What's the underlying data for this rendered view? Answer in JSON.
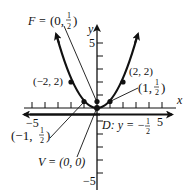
{
  "figure": {
    "type": "parabola-graph",
    "equation": "x^2 = 2y",
    "axes": {
      "x_label": "x",
      "y_label": "y",
      "x_ticks": {
        "min": -5,
        "max": 5,
        "step": 1,
        "labeled": [
          "-5",
          "5"
        ]
      },
      "y_ticks": {
        "min": -5,
        "max": 5,
        "step": 1,
        "labeled": [
          "5",
          "-5"
        ]
      }
    },
    "labels": {
      "focus": "F = (0, 1/2)",
      "focus_prefix": "F = ",
      "focus_open": "(0,",
      "focus_num": "1",
      "focus_den": "2",
      "focus_close": ")",
      "vertex": "V = (0, 0)",
      "directrix": "D: y = −",
      "directrix_num": "1",
      "directrix_den": "2",
      "point_left_high": "(−2, 2)",
      "point_right_high": "(2, 2)",
      "point_right_low_open": "(1,",
      "point_right_low_num": "1",
      "point_right_low_den": "2",
      "point_right_low_close": ")",
      "point_left_low_open": "(−1,",
      "point_left_low_num": "1",
      "point_left_low_den": "2",
      "point_left_low_close": ")",
      "x_tick_neg5": "−5",
      "x_tick_pos5": "5",
      "y_tick_pos5": "5",
      "y_tick_neg5": "−5",
      "x_axis_name": "x",
      "y_axis_name": "y"
    },
    "points": [
      {
        "name": "vertex",
        "x": 0,
        "y": 0
      },
      {
        "name": "focus",
        "x": 0,
        "y": 0.5
      },
      {
        "name": "left-low",
        "x": -1,
        "y": 0.5
      },
      {
        "name": "right-low",
        "x": 1,
        "y": 0.5
      },
      {
        "name": "left-high",
        "x": -2,
        "y": 2
      },
      {
        "name": "right-high",
        "x": 2,
        "y": 2
      }
    ],
    "directrix_y": -0.5,
    "colors": {
      "ink": "#111111",
      "background": "#ffffff"
    }
  }
}
